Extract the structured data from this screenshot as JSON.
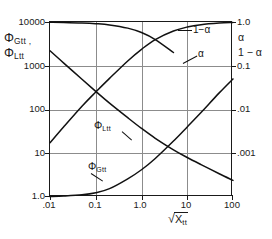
{
  "chart_data": {
    "type": "line",
    "title": "",
    "xlabel": "√X tt",
    "xlabel_parts": {
      "radical": "√",
      "base": "X",
      "sub": "tt"
    },
    "ylabel_left_lines": [
      "Φ Gtt ,",
      "Φ Ltt"
    ],
    "ylabel_right_lines": [
      "α",
      "1 − α"
    ],
    "xscale": "log",
    "yscale": "log",
    "xlim": [
      0.01,
      100
    ],
    "ylim_left": [
      1.0,
      10000
    ],
    "ylim_right": [
      0.001,
      1.0
    ],
    "grid": true,
    "legend": "none (inline curve labels)",
    "xticks": [
      0.01,
      0.1,
      1.0,
      10,
      100
    ],
    "xticklabels": [
      ".01",
      "0.1",
      "1.0",
      "10",
      "100"
    ],
    "yticks_left": [
      1.0,
      10,
      100,
      1000,
      10000
    ],
    "yticklabels_left": [
      "1.0",
      "10",
      "100",
      "1000",
      "10000"
    ],
    "yticks_right": [
      0.001,
      0.01,
      0.1,
      1.0
    ],
    "yticklabels_right": [
      ".001",
      ".01",
      "0.1",
      "1.0"
    ],
    "series": [
      {
        "name": "Φ Ltt",
        "label": "Φ Ltt",
        "axis": "left",
        "x": [
          0.01,
          0.02,
          0.05,
          0.1,
          0.2,
          0.5,
          1.0,
          2.0,
          5.0,
          10,
          20,
          50,
          100
        ],
        "y": [
          2200,
          1150,
          490,
          260,
          140,
          65,
          37,
          22,
          12.0,
          8.0,
          5.5,
          3.4,
          2.4
        ]
      },
      {
        "name": "Φ Gtt",
        "label": "Φ Gtt",
        "axis": "left",
        "x": [
          0.01,
          0.02,
          0.05,
          0.1,
          0.2,
          0.5,
          1.0,
          2.0,
          5.0,
          10,
          20,
          50,
          100
        ],
        "y": [
          1.02,
          1.05,
          1.12,
          1.25,
          1.55,
          2.6,
          4.2,
          7.6,
          19,
          40,
          85,
          240,
          500
        ]
      },
      {
        "name": "1 − α",
        "label": "1 − α",
        "axis": "right",
        "x": [
          0.01,
          0.02,
          0.05,
          0.1,
          0.2,
          0.5,
          1.0,
          2.0,
          5.0,
          10,
          20,
          50,
          100
        ],
        "y": [
          0.0085,
          0.016,
          0.036,
          0.063,
          0.108,
          0.215,
          0.34,
          0.5,
          0.7,
          0.82,
          0.9,
          0.96,
          0.985
        ]
      },
      {
        "name": "α",
        "label": "α",
        "axis": "right",
        "x": [
          0.01,
          0.02,
          0.05,
          0.1,
          0.2,
          0.5,
          1.0,
          2.0,
          5.0
        ],
        "y": [
          0.9915,
          0.984,
          0.964,
          0.937,
          0.892,
          0.785,
          0.66,
          0.5,
          0.3
        ]
      }
    ],
    "annotations": [
      {
        "text": "Φ Ltt",
        "name": "phi-ltt-label"
      },
      {
        "text": "Φ Gtt",
        "name": "phi-gtt-label"
      },
      {
        "text": "1−α",
        "name": "one-minus-alpha-label"
      },
      {
        "text": "α",
        "name": "alpha-label"
      }
    ]
  },
  "ticks": {
    "x": [
      ".01",
      "0.1",
      "1.0",
      "10",
      "100"
    ],
    "y_left": [
      "10000",
      "1000",
      "100",
      "10",
      "1.0"
    ],
    "y_right": [
      "1.0",
      "0.1",
      ".01",
      ".001"
    ]
  },
  "labels": {
    "y_left_line1_phi": "Φ",
    "y_left_line1_sub": "Gtt ,",
    "y_left_line2_phi": "Φ",
    "y_left_line2_sub": "Ltt",
    "y_right_line1": "α",
    "y_right_line2": "1 − α",
    "x_base": "X",
    "x_sub": "tt",
    "curve_phi_ltt_phi": "Φ",
    "curve_phi_ltt_sub": "Ltt",
    "curve_phi_gtt_phi": "Φ",
    "curve_phi_gtt_sub": "Gtt",
    "curve_one_minus_alpha": "1−α",
    "curve_alpha": "α"
  },
  "colors": {
    "curve": "#111111",
    "grid": "#8c8c8c",
    "frame": "#1a1a1a",
    "background": "#ffffff"
  }
}
